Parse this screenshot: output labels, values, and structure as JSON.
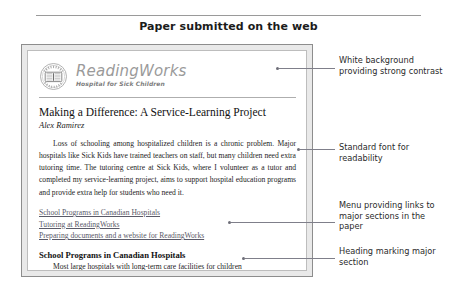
{
  "caption": "Paper submitted on the web",
  "document": {
    "logo": {
      "icon": "open-book-crest-icon",
      "crest_text": "HOSPITAL FOR SICK CHILDREN"
    },
    "brand_name": "ReadingWorks",
    "brand_tagline": "Hospital for Sick Children",
    "title": "Making a Difference: A Service-Learning Project",
    "author": "Alex Ramirez",
    "body": "Loss of schooling among hospitalized children is a chronic problem. Major hospitals like Sick Kids have trained teachers on staff, but many children need extra tutoring time. The tutoring centre at Sick Kids, where I volunteer as a tutor and completed my service-learning project, aims to support hospital education programs and provide extra help for students who need it.",
    "links": [
      "School Programs in Canadian Hospitals",
      "Tutoring at ReadingWorks",
      "Preparing documents and a website for ReadingWorks"
    ],
    "section_heading": "School Programs in Canadian Hospitals",
    "section_text": "Most large hospitals with long-term care facilities for children"
  },
  "callouts": [
    {
      "text": "White background providing strong contrast"
    },
    {
      "text": "Standard font for readability"
    },
    {
      "text": "Menu providing links to major sections in the paper"
    },
    {
      "text": "Heading marking major section"
    }
  ]
}
